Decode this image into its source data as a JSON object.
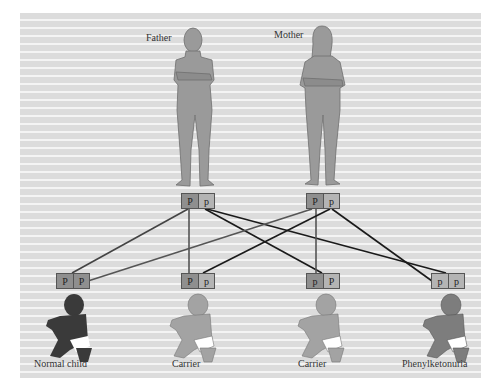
{
  "diagram": {
    "colors": {
      "background_stripe_dark": "#dcdcdc",
      "background_stripe_light": "#f4f4f4",
      "figure_gray": "#9a9a9a",
      "normal_child": "#3a3a3a",
      "carrier": "#a3a3a3",
      "affected": "#7d7d7d",
      "line_dark": "#1a1a1a",
      "line_mid": "#555555"
    },
    "parents": [
      {
        "label": "Father",
        "alleles": [
          "P",
          "p"
        ]
      },
      {
        "label": "Mother",
        "alleles": [
          "P",
          "p"
        ]
      }
    ],
    "children": [
      {
        "label": "Normal child",
        "alleles": [
          "P",
          "P"
        ]
      },
      {
        "label": "Carrier",
        "alleles": [
          "P",
          "p"
        ]
      },
      {
        "label": "Carrier",
        "alleles": [
          "p",
          "P"
        ]
      },
      {
        "label": "Phenylketonuria",
        "alleles": [
          "p",
          "p"
        ]
      }
    ]
  }
}
